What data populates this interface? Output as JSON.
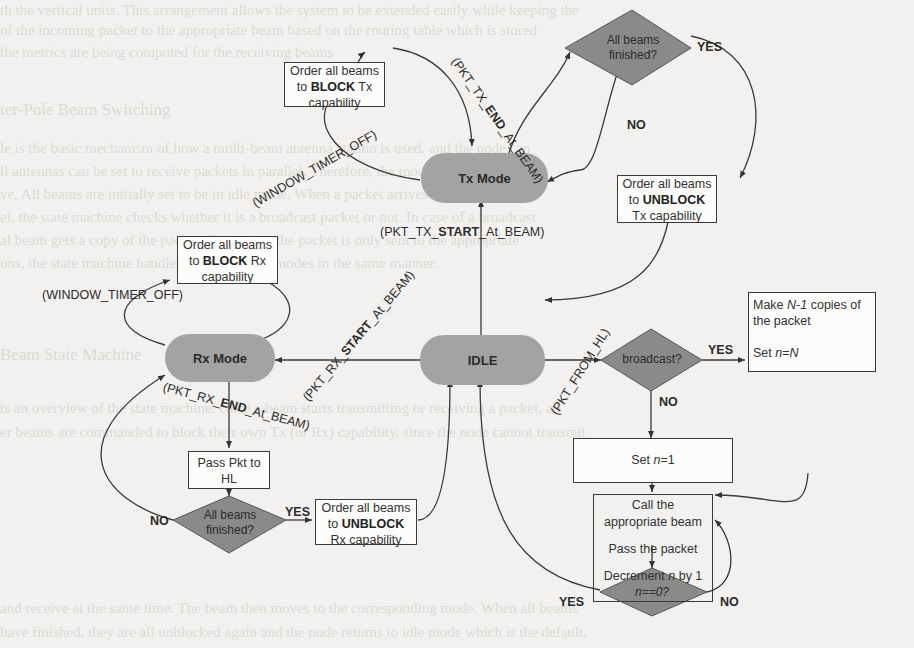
{
  "background_text": [
    "th the vertical units. This arrangement allows the system to be extended easily while keeping the",
    "of the incoming packet to the appropriate beam based on the routing table which is stored",
    "the metrics are being computed for the receiving beams",
    "ter-Pole Beam Switching",
    "le is the basic mechanism of how a multi-beam antenna station is used, and the node can",
    "ll antennas can be set to receive packets in parallel. Therefore, the mode of a beam can",
    "ve. All beams are initially set to be in idle mode. When a packet arrives from higher layer",
    "el, the state machine checks whether it is a broadcast packet or not. In case of a broadcast",
    "al beam gets a copy of the packet. Otherwise, the packet is only sent to the appropriate",
    "ons, the state machine handles the Tx and Rx modes in the same manner.",
    "Beam State Machine",
    "ts an overview of the state machine. Once a beam starts transmitting or receiving a packet, all",
    "er beams are commanded to block their own Tx (or Rx) capability, since the node cannot transmit",
    "and receive at the same time. The beam then moves to the corresponding mode. When all beams",
    "have finished, they are all unblocked again and the node returns to idle mode which is the default."
  ],
  "states": {
    "tx_mode": "Tx Mode",
    "rx_mode": "Rx Mode",
    "idle": "IDLE"
  },
  "boxes": {
    "block_tx": {
      "line1": "Order all beams",
      "pre": "to ",
      "bold": "BLOCK",
      "post": " Tx",
      "line3": "capability"
    },
    "unblock_tx": {
      "line1": "Order all beams",
      "pre": "to ",
      "bold": "UNBLOCK",
      "post": "",
      "line3": "Tx capability"
    },
    "block_rx": {
      "line1": "Order all beams",
      "pre": "to ",
      "bold": "BLOCK",
      "post": " Rx",
      "line3": "capability"
    },
    "unblock_rx": {
      "line1": "Order all beams",
      "pre": "to ",
      "bold": "UNBLOCK",
      "post": "",
      "line3": "Rx capability"
    },
    "pass_pkt": {
      "line1": "Pass Pkt to",
      "line2": "HL"
    },
    "make_copies": {
      "a": "Make ",
      "n1": "N-1",
      "b": " copies of",
      "line2": "the packet",
      "c": "Set ",
      "n": "n",
      "eq": "=",
      "N": "N"
    },
    "set_n1": {
      "a": "Set ",
      "n": "n",
      "b": "=1"
    },
    "call_beam": {
      "line1": "Call the",
      "line2": "appropriate beam",
      "line3": "Pass the packet",
      "a": "Decrement ",
      "n": "n",
      "b": " by 1"
    }
  },
  "decisions": {
    "tx_all_finished": {
      "line1": "All beams",
      "line2": "finished?"
    },
    "rx_all_finished": {
      "line1": "All beams",
      "line2": "finished?"
    },
    "broadcast": "broadcast?",
    "n_zero": "n==0?"
  },
  "edge_labels": {
    "pkt_tx_end": {
      "pre": "(PKT_TX_",
      "bold": "END",
      "post": "_At_BEAM)"
    },
    "window_timer_tx": "(WINDOW_TIMER_OFF)",
    "pkt_tx_start": {
      "pre": "(PKT_TX_",
      "bold": "START",
      "post": "_At_BEAM)"
    },
    "window_timer_rx": "(WINDOW_TIMER_OFF)",
    "pkt_rx_start": {
      "pre": "(PKT_RX_",
      "bold": "START",
      "post": "_At_BEAM)"
    },
    "pkt_rx_end": {
      "pre": "(PKT_RX_",
      "bold": "END",
      "post": "_At_BEAM)"
    },
    "pkt_from_hl": "(PKT_FROM_HL)"
  },
  "branch_labels": {
    "tx_yes": "YES",
    "tx_no": "NO",
    "broadcast_yes": "YES",
    "broadcast_no": "NO",
    "rx_yes": "YES",
    "rx_no": "NO",
    "n_yes": "YES",
    "n_no": "NO"
  },
  "colors": {
    "state_fill": "#a3a3a3",
    "decision_fill": "#8a8a8a",
    "line": "#3a3a3a",
    "background": "#f2f1ef"
  }
}
